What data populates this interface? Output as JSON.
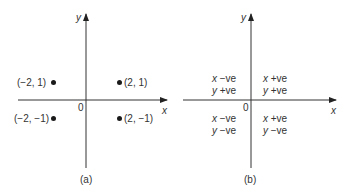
{
  "panel_a": {
    "caption": "(a)",
    "x_axis_label": "x",
    "y_axis_label": "y",
    "origin_label": "0",
    "points": [
      {
        "label": "(−2, 1)",
        "x": -2,
        "y": 1
      },
      {
        "label": "(2, 1)",
        "x": 2,
        "y": 1
      },
      {
        "label": "(−2, −1)",
        "x": -2,
        "y": -1
      },
      {
        "label": "(2, −1)",
        "x": 2,
        "y": -1
      }
    ]
  },
  "panel_b": {
    "caption": "(b)",
    "x_axis_label": "x",
    "y_axis_label": "y",
    "origin_label": "0",
    "quadrants": {
      "top_left": {
        "x_var": "x",
        "x_sign": "−ve",
        "y_var": "y",
        "y_sign": "+ve"
      },
      "top_right": {
        "x_var": "x",
        "x_sign": "+ve",
        "y_var": "y",
        "y_sign": "+ve"
      },
      "bottom_left": {
        "x_var": "x",
        "x_sign": "−ve",
        "y_var": "y",
        "y_sign": "−ve"
      },
      "bottom_right": {
        "x_var": "x",
        "x_sign": "+ve",
        "y_var": "y",
        "y_sign": "−ve"
      }
    }
  },
  "colors": {
    "axis": "#333333",
    "text": "#333333",
    "point": "#1a1a1a"
  }
}
